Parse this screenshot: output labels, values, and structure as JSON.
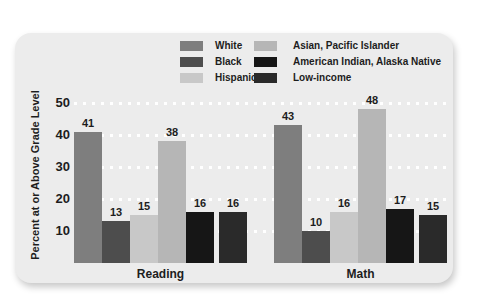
{
  "colors": {
    "page_bg": "#ffffff",
    "card_bg": "#ececec",
    "grid_dot": "#ffffff",
    "text": "#1d1d1d"
  },
  "chart_data": {
    "type": "bar",
    "title": "",
    "ylabel": "Percent at or Above Grade Level",
    "xlabel": "",
    "ylim": [
      0,
      52
    ],
    "yticks": [
      10,
      20,
      30,
      40,
      50
    ],
    "grid": "horizontal-dashed-white",
    "legend_position": "top",
    "value_labels_shown": true,
    "categories": [
      "Reading",
      "Math"
    ],
    "series": [
      {
        "name": "White",
        "color": "#7e7e7e",
        "values": [
          41,
          43
        ]
      },
      {
        "name": "Black",
        "color": "#4d4d4d",
        "values": [
          13,
          10
        ]
      },
      {
        "name": "Hispanic",
        "color": "#c8c8c8",
        "values": [
          15,
          16
        ]
      },
      {
        "name": "Asian, Pacific Islander",
        "color": "#b6b6b6",
        "values": [
          38,
          48
        ]
      },
      {
        "name": "American Indian, Alaska Native",
        "color": "#161616",
        "values": [
          16,
          17
        ]
      },
      {
        "name": "Low-income",
        "color": "#2a2a2a",
        "values": [
          16,
          15
        ]
      }
    ]
  }
}
